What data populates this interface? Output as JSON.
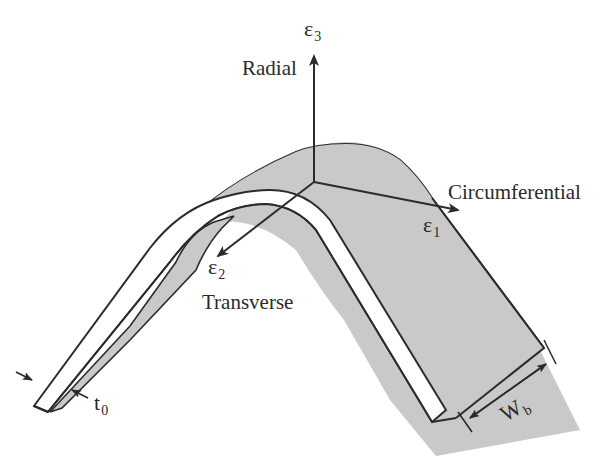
{
  "diagram": {
    "type": "bent strip with strain axes",
    "colors": {
      "outline": "#2b2b2b",
      "fill": "#c9c9c9",
      "edge_face": "#ffffff",
      "background": "#ffffff"
    },
    "axes": {
      "radial": {
        "label": "Radial",
        "symbol": "ε",
        "subscript": "3"
      },
      "transverse": {
        "label": "Transverse",
        "symbol": "ε",
        "subscript": "2"
      },
      "circumferential": {
        "label": "Circumferential",
        "symbol": "ε",
        "subscript": "1"
      }
    },
    "dimensions": {
      "thickness": {
        "symbol": "t",
        "subscript": "0"
      },
      "width": {
        "symbol": "W",
        "subscript": "b"
      }
    }
  }
}
